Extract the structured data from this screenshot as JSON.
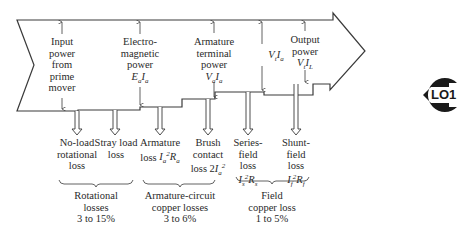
{
  "colors": {
    "stroke": "#3a3a3a",
    "text": "#2a2a2a",
    "badge": "#1a1a1a",
    "background": "#ffffff"
  },
  "flow_arrow": {
    "top_labels": [
      {
        "id": "input",
        "lines": [
          "Input",
          "power",
          "from",
          "prime",
          "mover"
        ]
      },
      {
        "id": "electromagnetic",
        "lines": [
          "Electro-",
          "magnetic",
          "power"
        ],
        "formula": "E_a I_a"
      },
      {
        "id": "armature-terminal",
        "lines": [
          "Armature",
          "terminal",
          "power"
        ],
        "formula": "V_a I_a"
      },
      {
        "id": "vt-ia",
        "lines": [],
        "formula": "V_t I_a"
      },
      {
        "id": "output",
        "lines": [
          "Output",
          "power"
        ],
        "formula": "V_t I_L"
      }
    ]
  },
  "losses": [
    {
      "id": "no-load-rotational",
      "lines": [
        "No-load",
        "rotational",
        "loss"
      ]
    },
    {
      "id": "stray-load",
      "lines": [
        "Stray load",
        "loss"
      ]
    },
    {
      "id": "armature",
      "lines": [
        "Armature",
        "loss"
      ],
      "formula": "I_a^2 R_a"
    },
    {
      "id": "brush-contact",
      "lines": [
        "Brush",
        "contact",
        "loss"
      ],
      "formula": "2I_a^2"
    },
    {
      "id": "series-field",
      "lines": [
        "Series-",
        "field",
        "loss"
      ],
      "formula": "I_s^2 R_s"
    },
    {
      "id": "shunt-field",
      "lines": [
        "Shunt-",
        "field",
        "loss"
      ],
      "formula": "I_f^2 R_f"
    }
  ],
  "groups": [
    {
      "id": "rotational",
      "lines": [
        "Rotational",
        "losses",
        "3 to 15%"
      ]
    },
    {
      "id": "armature-circuit",
      "lines": [
        "Armature-circuit",
        "copper losses",
        "3 to 6%"
      ]
    },
    {
      "id": "field-copper",
      "lines": [
        "Field",
        "copper loss",
        "1 to 5%"
      ]
    }
  ],
  "badge": {
    "label": "LO1"
  },
  "text": {
    "t_input_1": "Input",
    "t_input_2": "power",
    "t_input_3": "from",
    "t_input_4": "prime",
    "t_input_5": "mover",
    "t_em_1": "Electro-",
    "t_em_2": "magnetic",
    "t_em_3": "power",
    "t_at_1": "Armature",
    "t_at_2": "terminal",
    "t_at_3": "power",
    "t_out_1": "Output",
    "t_out_2": "power",
    "l_nl_1": "No-load",
    "l_nl_2": "rotational",
    "l_nl_3": "loss",
    "l_sl_1": "Stray load",
    "l_sl_2": "loss",
    "l_ar_1": "Armature",
    "l_ar_2": "loss",
    "l_br_1": "Brush",
    "l_br_2": "contact",
    "l_br_3": "loss 2",
    "l_se_1": "Series-",
    "l_se_2": "field",
    "l_se_3": "loss",
    "l_sh_1": "Shunt-",
    "l_sh_2": "field",
    "l_sh_3": "loss",
    "g_rot_1": "Rotational",
    "g_rot_2": "losses",
    "g_rot_3": "3 to 15%",
    "g_arm_1": "Armature-circuit",
    "g_arm_2": "copper losses",
    "g_arm_3": "3 to 6%",
    "g_fld_1": "Field",
    "g_fld_2": "copper loss",
    "g_fld_3": "1 to 5%",
    "badge": "LO1"
  }
}
